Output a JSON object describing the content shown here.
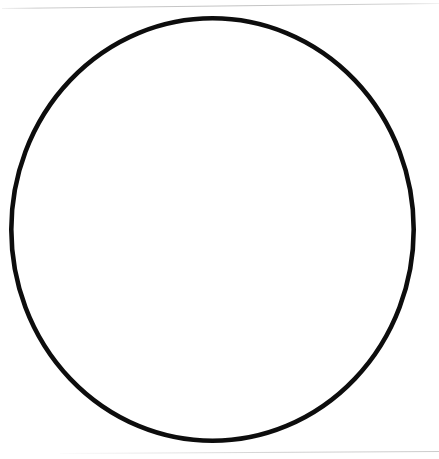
{
  "page": {
    "kind": "scanned-page",
    "background_color": "#ffffff",
    "width": 439,
    "height": 459,
    "caption": ""
  },
  "scan_artifacts": {
    "edge_rule_color": "#c8c8c8",
    "top_rule": {
      "name": "top-page-edge",
      "y_left": 8,
      "y_right": 3,
      "skew_degrees": -0.66
    },
    "bottom_rule": {
      "name": "bottom-page-edge",
      "y_left": 453,
      "y_right": 451,
      "skew_degrees": -0.3
    }
  },
  "figure": {
    "name": "circle-outline",
    "shape": "circle",
    "label": "",
    "stroke_color": "#0d0d0d",
    "fill_color": "#ffffff",
    "stroke_width": 4.6,
    "center_x": 212.5,
    "center_y": 229.5,
    "radius_x": 203.5,
    "radius_y": 213.5,
    "bounds": {
      "left": 9,
      "top": 16,
      "right": 416,
      "bottom": 443
    }
  }
}
